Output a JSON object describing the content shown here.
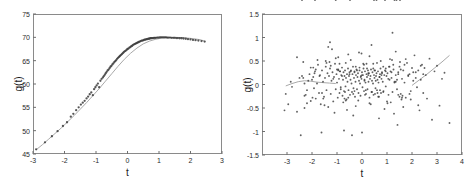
{
  "figure": {
    "background": "#ffffff",
    "point_color": "#3a3a3a",
    "line_color": "#a9a9a9",
    "frame_color": "#8a8a8a"
  },
  "chart_data": [
    {
      "type": "scatter",
      "panel": "left",
      "title": "",
      "xlabel": "t",
      "ylabel": "g(t)",
      "xlim": [
        -3,
        3
      ],
      "ylim": [
        45,
        75
      ],
      "xticks": [
        -3,
        -2,
        -1,
        0,
        1,
        2,
        3
      ],
      "xticklabels": [
        "-3",
        "-2",
        "-1",
        "0",
        "1",
        "2",
        "3"
      ],
      "yticks": [
        45,
        50,
        55,
        60,
        65,
        70,
        75
      ],
      "yticklabels": [
        "45",
        "50",
        "55",
        "60",
        "65",
        "70",
        "75"
      ],
      "grid": false,
      "legend": "none",
      "description": "Sigmoid-shaped growth curve: dense band of data points rising from about 46 at t=-2.9 to a plateau near 70 for t>1, with a slight decline past t=2. A thin grey fitted curve runs through the points.",
      "fit_line": {
        "name": "fitted curve",
        "x": [
          -2.9,
          -2.7,
          -2.5,
          -2.3,
          -2.1,
          -1.9,
          -1.7,
          -1.5,
          -1.3,
          -1.1,
          -0.9,
          -0.7,
          -0.5,
          -0.3,
          -0.1,
          0.1,
          0.3,
          0.5,
          0.7,
          0.9,
          1.1,
          1.3,
          1.5,
          1.7,
          1.9,
          2.1,
          2.3,
          2.45
        ],
        "y": [
          45.9,
          47.0,
          48.2,
          49.4,
          50.6,
          51.9,
          53.2,
          54.6,
          56.0,
          57.5,
          59.0,
          60.6,
          62.2,
          63.8,
          65.3,
          66.6,
          67.7,
          68.6,
          69.2,
          69.6,
          69.85,
          69.95,
          70.0,
          69.95,
          69.85,
          69.7,
          69.5,
          69.2
        ]
      },
      "scatter_points": {
        "x": [
          -2.9,
          -2.62,
          -2.4,
          -2.22,
          -2.05,
          -1.92,
          -1.8,
          -1.72,
          -1.63,
          -1.55,
          -1.48,
          -1.42,
          -1.36,
          -1.3,
          -1.25,
          -1.2,
          -1.15,
          -1.1,
          -1.06,
          -1.02,
          -0.98,
          -0.94,
          -0.9,
          -0.86,
          -0.82,
          -0.78,
          -0.75,
          -0.72,
          -0.69,
          -0.66,
          -0.63,
          -0.6,
          -0.57,
          -0.54,
          -0.51,
          -0.48,
          -0.45,
          -0.42,
          -0.39,
          -0.36,
          -0.33,
          -0.3,
          -0.27,
          -0.24,
          -0.21,
          -0.18,
          -0.15,
          -0.12,
          -0.09,
          -0.06,
          -0.03,
          0.0,
          0.03,
          0.06,
          0.09,
          0.12,
          0.15,
          0.18,
          0.21,
          0.24,
          0.27,
          0.3,
          0.33,
          0.36,
          0.39,
          0.42,
          0.45,
          0.48,
          0.51,
          0.54,
          0.57,
          0.6,
          0.63,
          0.66,
          0.69,
          0.72,
          0.75,
          0.78,
          0.81,
          0.84,
          0.87,
          0.9,
          0.94,
          0.98,
          1.02,
          1.06,
          1.1,
          1.14,
          1.18,
          1.22,
          1.26,
          1.3,
          1.35,
          1.4,
          1.45,
          1.5,
          1.55,
          1.6,
          1.66,
          1.72,
          1.78,
          1.85,
          1.92,
          2.0,
          2.08,
          2.16,
          2.25,
          2.35,
          2.45
        ],
        "y": [
          46.0,
          47.5,
          48.8,
          49.9,
          51.0,
          51.8,
          53.0,
          53.6,
          54.4,
          55.0,
          55.6,
          56.0,
          56.4,
          56.9,
          57.3,
          57.8,
          58.2,
          57.6,
          58.9,
          59.3,
          59.7,
          60.1,
          59.3,
          60.7,
          61.1,
          61.4,
          61.7,
          62.0,
          62.3,
          62.6,
          62.9,
          63.1,
          63.4,
          63.7,
          63.9,
          64.2,
          64.4,
          64.7,
          64.9,
          65.1,
          65.4,
          65.6,
          65.8,
          66.0,
          66.2,
          66.4,
          66.6,
          66.8,
          67.0,
          67.1,
          67.3,
          67.5,
          67.6,
          67.8,
          67.9,
          68.1,
          68.2,
          68.4,
          68.5,
          68.6,
          68.7,
          68.8,
          68.9,
          69.0,
          69.1,
          69.2,
          69.3,
          69.3,
          69.4,
          69.5,
          69.5,
          69.6,
          69.6,
          69.7,
          69.7,
          69.8,
          69.8,
          69.85,
          69.85,
          69.9,
          69.9,
          69.9,
          69.95,
          69.95,
          70.0,
          70.0,
          70.0,
          70.0,
          70.0,
          70.0,
          69.95,
          69.95,
          69.95,
          69.9,
          69.9,
          69.9,
          69.85,
          69.85,
          69.8,
          69.8,
          69.75,
          69.7,
          69.6,
          69.55,
          69.45,
          69.4,
          69.3,
          69.2,
          69.1
        ]
      }
    },
    {
      "type": "scatter",
      "panel": "right",
      "title": "",
      "xlabel": "t",
      "ylabel": "g(t)",
      "xlim": [
        -4,
        4
      ],
      "ylim": [
        -1.5,
        1.5
      ],
      "xticks": [
        -3,
        -2,
        -1,
        0,
        1,
        2,
        3,
        4
      ],
      "xticklabels": [
        "-3",
        "-2",
        "-1",
        "0",
        "1",
        "2",
        "3",
        "4"
      ],
      "yticks": [
        -1.5,
        -1,
        -0.5,
        0,
        0.5,
        1,
        1.5
      ],
      "yticklabels": [
        "-1.5",
        "-1",
        "-0.5",
        "0",
        "0.5",
        "1",
        "1.5"
      ],
      "grid": false,
      "legend": "none",
      "description": "Residual scatter cloud centred near zero, densest between t=-1.5 and t=1.5, spread roughly -0.5 to 0.5 with scattered outliers reaching +1.1 and -1.1. A faint grey smoother line runs near zero on the left and rises steeply from about t=2 to t=3.5.",
      "fit_line_left": {
        "x": [
          -3.05,
          -2.8,
          -2.55,
          -2.3,
          -2.05,
          -1.8,
          -1.55,
          -1.3,
          -1.05
        ],
        "y": [
          -0.03,
          0.02,
          0.06,
          0.08,
          0.07,
          0.05,
          0.04,
          0.03,
          0.02
        ]
      },
      "fit_line_right": {
        "x": [
          2.0,
          2.3,
          2.6,
          2.9,
          3.2,
          3.5
        ],
        "y": [
          -0.02,
          0.1,
          0.22,
          0.35,
          0.48,
          0.62
        ]
      },
      "scatter_points": {
        "x": [
          -3.1,
          -3.05,
          -2.95,
          -2.85,
          -2.8,
          -2.6,
          -2.45,
          -2.4,
          -2.35,
          -2.3,
          -2.25,
          -2.2,
          -2.15,
          -2.1,
          -2.05,
          -2.0,
          -1.95,
          -1.92,
          -1.88,
          -1.85,
          -1.8,
          -1.76,
          -1.72,
          -1.68,
          -1.65,
          -1.6,
          -1.56,
          -1.52,
          -1.48,
          -1.45,
          -1.42,
          -1.38,
          -1.35,
          -1.32,
          -1.28,
          -1.25,
          -1.22,
          -1.18,
          -1.15,
          -1.12,
          -1.08,
          -1.05,
          -1.02,
          -1.0,
          -0.97,
          -0.95,
          -0.92,
          -0.9,
          -0.88,
          -0.85,
          -0.83,
          -0.8,
          -0.78,
          -0.76,
          -0.74,
          -0.72,
          -0.7,
          -0.68,
          -0.66,
          -0.64,
          -0.62,
          -0.6,
          -0.58,
          -0.56,
          -0.54,
          -0.52,
          -0.5,
          -0.48,
          -0.46,
          -0.44,
          -0.42,
          -0.4,
          -0.38,
          -0.36,
          -0.34,
          -0.32,
          -0.3,
          -0.28,
          -0.26,
          -0.24,
          -0.22,
          -0.2,
          -0.18,
          -0.16,
          -0.14,
          -0.12,
          -0.1,
          -0.08,
          -0.06,
          -0.04,
          -0.02,
          0.0,
          0.02,
          0.04,
          0.06,
          0.08,
          0.1,
          0.12,
          0.14,
          0.16,
          0.18,
          0.2,
          0.22,
          0.24,
          0.26,
          0.28,
          0.3,
          0.32,
          0.34,
          0.36,
          0.38,
          0.4,
          0.42,
          0.44,
          0.46,
          0.48,
          0.5,
          0.52,
          0.54,
          0.56,
          0.58,
          0.6,
          0.62,
          0.64,
          0.66,
          0.68,
          0.7,
          0.72,
          0.74,
          0.76,
          0.78,
          0.8,
          0.83,
          0.86,
          0.89,
          0.92,
          0.95,
          0.98,
          1.02,
          1.06,
          1.1,
          1.14,
          1.18,
          1.22,
          1.26,
          1.3,
          1.35,
          1.4,
          1.45,
          1.5,
          1.55,
          1.6,
          1.65,
          1.7,
          1.75,
          1.8,
          1.85,
          1.9,
          1.95,
          2.0,
          2.05,
          2.1,
          2.15,
          2.2,
          2.25,
          2.3,
          2.35,
          2.4,
          2.45,
          2.5,
          2.55,
          2.6,
          2.7,
          2.8,
          2.9,
          3.0,
          3.1,
          3.2,
          3.3,
          3.5,
          -2.35,
          -2.3,
          -1.95,
          -1.7,
          -1.55,
          -1.35,
          -1.2,
          -1.05,
          -0.95,
          -0.85,
          -0.75,
          -0.65,
          -0.55,
          -0.45,
          -0.35,
          -0.25,
          -0.15,
          -0.05,
          0.05,
          0.15,
          0.25,
          0.35,
          0.45,
          0.55,
          0.65,
          0.75,
          0.85,
          0.95,
          1.05,
          1.15,
          1.25,
          1.35,
          1.45,
          1.55,
          1.65,
          1.75,
          1.85,
          1.95,
          2.05,
          2.15,
          2.25,
          2.35,
          2.45,
          -1.6,
          -1.3,
          -1.1,
          -0.9,
          -0.7,
          -0.5,
          -0.3,
          -0.1,
          0.1,
          0.3,
          0.5,
          0.7,
          0.9,
          1.1,
          1.3,
          1.5,
          1.7,
          1.9,
          -1.45,
          -1.15,
          -0.95,
          -0.65,
          -0.45,
          -0.25,
          0.0,
          0.2,
          0.4,
          0.6,
          0.8,
          1.0,
          1.2,
          1.4,
          1.6,
          -1.25,
          -0.8,
          -0.55,
          -0.2,
          0.12,
          0.45,
          0.72,
          1.08,
          1.45,
          -0.6,
          -0.3,
          0.0,
          0.3,
          0.62,
          0.95,
          1.28,
          1.52,
          -2.5,
          -2.2,
          -1.9,
          -1.5,
          -1.0,
          -0.4,
          0.25,
          0.85,
          1.35,
          1.62,
          -1.78,
          -1.28,
          -0.68,
          0.18,
          0.68,
          1.18,
          1.58,
          -2.05,
          -1.62,
          -0.88,
          -0.12,
          0.52,
          1.12,
          1.42,
          -1.42,
          -0.72,
          0.08,
          0.78,
          1.22,
          -2.3,
          -1.85,
          -0.35,
          0.38,
          1.02,
          -2.6,
          -1.98,
          -0.02,
          0.92,
          1.52,
          -2.4,
          -1.05,
          0.58,
          1.3,
          -1.88,
          -0.48,
          0.48,
          1.38
        ],
        "y": [
          -0.55,
          -0.2,
          -0.42,
          0.06,
          -0.05,
          -0.58,
          -1.08,
          0.18,
          0.14,
          0.02,
          -0.22,
          -0.12,
          0.08,
          0.22,
          -0.35,
          0.1,
          0.16,
          -0.08,
          0.28,
          -0.3,
          0.02,
          0.42,
          -0.18,
          0.2,
          -0.42,
          0.3,
          0.06,
          -0.26,
          0.14,
          0.38,
          -0.12,
          0.24,
          -0.48,
          0.18,
          0.34,
          -0.2,
          0.08,
          0.26,
          -0.36,
          0.16,
          0.44,
          -0.1,
          0.22,
          0.04,
          -0.28,
          0.32,
          0.12,
          -0.18,
          0.28,
          -0.06,
          0.2,
          0.36,
          -0.24,
          0.1,
          0.26,
          -0.14,
          0.18,
          0.3,
          -0.04,
          0.14,
          -0.32,
          0.22,
          0.06,
          0.34,
          -0.12,
          0.18,
          0.26,
          -0.22,
          0.1,
          0.3,
          0.02,
          -0.16,
          0.22,
          0.38,
          -0.08,
          0.14,
          0.28,
          -0.26,
          0.06,
          0.2,
          0.32,
          -0.1,
          0.16,
          0.24,
          -0.18,
          0.08,
          0.3,
          0.02,
          -0.24,
          0.18,
          0.12,
          0.26,
          -0.06,
          0.2,
          0.34,
          -0.14,
          0.1,
          0.28,
          0.04,
          -0.2,
          0.22,
          0.16,
          -0.1,
          0.3,
          0.06,
          0.24,
          -0.28,
          0.12,
          0.18,
          0.32,
          -0.16,
          0.08,
          0.26,
          0.02,
          -0.22,
          0.2,
          0.14,
          0.3,
          -0.08,
          0.18,
          0.24,
          -0.12,
          0.1,
          0.28,
          0.04,
          -0.26,
          0.16,
          0.22,
          0.34,
          -0.18,
          0.12,
          0.26,
          0.06,
          -0.14,
          0.2,
          0.3,
          -0.04,
          0.18,
          0.24,
          -0.22,
          0.1,
          0.28,
          0.14,
          -0.16,
          0.32,
          0.06,
          0.2,
          -0.1,
          0.26,
          0.38,
          -0.2,
          0.12,
          0.3,
          0.04,
          -0.28,
          0.46,
          0.18,
          0.22,
          -0.14,
          0.35,
          0.08,
          0.62,
          0.26,
          -0.06,
          0.3,
          -0.55,
          0.1,
          0.42,
          -0.18,
          0.35,
          0.2,
          -0.3,
          0.55,
          -0.75,
          0.28,
          0.4,
          -0.45,
          0.12,
          0.25,
          -0.82,
          0.48,
          -0.24,
          0.36,
          0.18,
          -0.3,
          0.8,
          0.75,
          0.56,
          0.3,
          -0.1,
          -0.38,
          0.46,
          -0.28,
          0.52,
          -0.2,
          0.38,
          -0.34,
          0.16,
          0.44,
          -0.12,
          0.24,
          -0.42,
          0.34,
          0.08,
          -0.26,
          0.5,
          -0.16,
          0.28,
          0.12,
          -0.38,
          0.42,
          0.06,
          -0.22,
          0.32,
          -0.48,
          0.54,
          0.2,
          -0.32,
          0.26,
          0.14,
          -0.44,
          0.4,
          0.22,
          -0.18,
          0.48,
          -0.6,
          0.44,
          -0.3,
          0.22,
          -0.14,
          0.36,
          0.08,
          -0.4,
          0.3,
          0.16,
          -0.52,
          0.38,
          0.04,
          -0.26,
          0.42,
          -0.2,
          0.5,
          0.12,
          0.58,
          -0.34,
          0.28,
          -0.46,
          0.2,
          0.34,
          -0.16,
          0.46,
          0.24,
          -0.36,
          0.52,
          0.1,
          -0.28,
          0.4,
          0.18,
          0.64,
          0.3,
          -0.22,
          0.44,
          -0.12,
          0.38,
          0.22,
          -0.54,
          0.26,
          -1.02,
          0.6,
          -0.18,
          0.34,
          -0.62,
          0.48,
          0.14,
          -0.4,
          0.24,
          -0.44,
          0.32,
          -1.08,
          0.2,
          0.38,
          0.7,
          -0.24,
          0.52,
          0.9,
          -0.16,
          0.44,
          -0.72,
          0.26,
          -0.32,
          0.36,
          -1.02,
          0.28,
          0.68,
          -0.2,
          0.54,
          -0.86,
          0.46,
          -0.98,
          0.42,
          0.2,
          1.1,
          -0.5,
          0.32,
          -0.66,
          0.84,
          -0.4,
          0.58,
          -0.28,
          0.66
        ]
      }
    }
  ]
}
